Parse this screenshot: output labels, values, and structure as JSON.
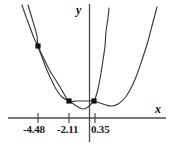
{
  "figure": {
    "width": 171,
    "height": 146,
    "background": "#ffffff",
    "stroke_color": "#3a3a3a",
    "axis_color": "#4a4a4a",
    "marker_color": "#111111"
  },
  "axes": {
    "x_label": "x",
    "y_label": "y",
    "x_axis_pixel_y": 118,
    "y_axis_pixel_x": 89.5,
    "x_tick_labels": [
      "-4.48",
      "-2.11",
      "0.35"
    ],
    "x_tick_pixel_positions": [
      38,
      69,
      95
    ],
    "x_tick_values": [
      -4.48,
      -2.11,
      0.35
    ]
  },
  "chart_data": {
    "type": "line",
    "title": "",
    "xlabel": "x",
    "ylabel": "y",
    "grid": false,
    "legend": false,
    "xlim": [
      -7.2,
      3.6
    ],
    "ylim": [
      -1.4,
      12.0
    ],
    "x_ticks": [
      -4.48,
      -2.11,
      0.35
    ],
    "x_tick_labels": [
      "-4.48",
      "-2.11",
      "0.35"
    ],
    "y_ticks": [],
    "y_tick_labels": [],
    "intersection_points": [
      {
        "x": -4.48,
        "y": 6.1,
        "label": "-4.48"
      },
      {
        "x": -2.11,
        "y": 1.25,
        "label": "-2.11"
      },
      {
        "x": 0.35,
        "y": 1.25,
        "label": "0.35"
      }
    ],
    "series": [
      {
        "name": "wide-parabola",
        "type": "curve",
        "description": "flatter upward parabola passing through all three marked points",
        "points_px": [
          [
            22,
            5
          ],
          [
            25,
            14
          ],
          [
            28,
            22
          ],
          [
            31,
            30
          ],
          [
            34,
            38
          ],
          [
            38,
            46
          ],
          [
            42,
            55
          ],
          [
            46,
            63
          ],
          [
            50,
            71
          ],
          [
            55,
            79
          ],
          [
            60,
            87
          ],
          [
            64,
            94
          ],
          [
            69,
            101
          ],
          [
            76,
            101
          ],
          [
            83,
            101
          ],
          [
            89,
            101
          ],
          [
            94,
            101
          ],
          [
            100,
            103
          ],
          [
            106,
            105
          ],
          [
            112,
            106
          ],
          [
            118,
            104
          ],
          [
            124,
            99
          ],
          [
            130,
            90
          ],
          [
            136,
            77
          ],
          [
            142,
            60
          ],
          [
            148,
            41
          ],
          [
            153,
            22
          ],
          [
            157,
            7
          ]
        ]
      },
      {
        "name": "narrow-parabola",
        "type": "curve",
        "description": "steeper upward parabola through the three marked points, dipping below the x-axis near its vertex",
        "points_px": [
          [
            28,
            5
          ],
          [
            31,
            15
          ],
          [
            34,
            25
          ],
          [
            37,
            36
          ],
          [
            38,
            46
          ],
          [
            42,
            57
          ],
          [
            46,
            68
          ],
          [
            51,
            79
          ],
          [
            56,
            89
          ],
          [
            62,
            97
          ],
          [
            69,
            101
          ],
          [
            75,
            105
          ],
          [
            80,
            108
          ],
          [
            84,
            109
          ],
          [
            88,
            107
          ],
          [
            91,
            104
          ],
          [
            94,
            101
          ],
          [
            97,
            93
          ],
          [
            99,
            84
          ],
          [
            101,
            73
          ],
          [
            103,
            60
          ],
          [
            105,
            46
          ],
          [
            106,
            32
          ],
          [
            108,
            18
          ],
          [
            109,
            8
          ]
        ]
      }
    ],
    "markers": [
      {
        "name": "point-a",
        "px": [
          38,
          46
        ],
        "shape": "square"
      },
      {
        "name": "point-b",
        "px": [
          69,
          101
        ],
        "shape": "square"
      },
      {
        "name": "point-c",
        "px": [
          94,
          101
        ],
        "shape": "square"
      }
    ]
  }
}
